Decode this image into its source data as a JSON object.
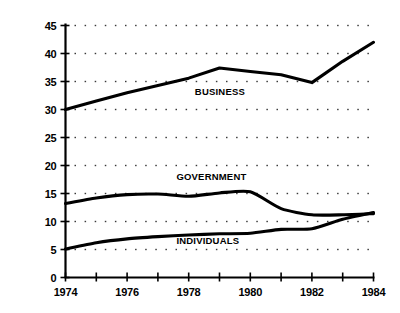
{
  "chart_data": {
    "type": "line",
    "title": "",
    "subtitle": "",
    "xlabel": "",
    "ylabel": "",
    "xlim": [
      1974,
      1984
    ],
    "ylim": [
      0,
      45
    ],
    "grid": true,
    "grid_style": "dotted-horizontal",
    "legend_position": "inline-labels",
    "y_ticks": [
      0,
      5,
      10,
      15,
      20,
      25,
      30,
      35,
      40,
      45
    ],
    "y_tick_labels": [
      "0",
      "5",
      "10",
      "15",
      "20",
      "25",
      "30",
      "35",
      "40",
      "45"
    ],
    "x_ticks": [
      1974,
      1975,
      1976,
      1977,
      1978,
      1979,
      1980,
      1981,
      1982,
      1983,
      1984
    ],
    "x_tick_labels": [
      "1974",
      "",
      "1976",
      "",
      "1978",
      "",
      "1980",
      "",
      "1982",
      "",
      "1984"
    ],
    "x": [
      1974,
      1975,
      1976,
      1977,
      1978,
      1979,
      1980,
      1981,
      1982,
      1983,
      1984
    ],
    "series": [
      {
        "name": "BUSINESS",
        "label": "BUSINESS",
        "color": "#000000",
        "values": [
          30.0,
          31.5,
          33.0,
          34.3,
          35.6,
          37.4,
          36.8,
          36.2,
          34.8,
          38.6,
          42.0
        ],
        "label_x": 1978.2,
        "label_y": 32.6
      },
      {
        "name": "GOVERNMENT",
        "label": "GOVERNMENT",
        "color": "#000000",
        "values": [
          13.2,
          14.2,
          14.8,
          14.9,
          14.5,
          15.1,
          15.3,
          12.3,
          11.2,
          11.2,
          11.4
        ],
        "label_x": 1977.6,
        "label_y": 17.4
      },
      {
        "name": "INDIVIDUALS",
        "label": "INDIVIDUALS",
        "color": "#000000",
        "values": [
          5.1,
          6.2,
          6.9,
          7.3,
          7.6,
          7.8,
          7.9,
          8.6,
          8.7,
          10.4,
          11.6
        ],
        "label_x": 1977.6,
        "label_y": 5.9
      }
    ]
  },
  "axes": {
    "y_axis_name": "y-axis",
    "x_axis_name": "x-axis"
  }
}
